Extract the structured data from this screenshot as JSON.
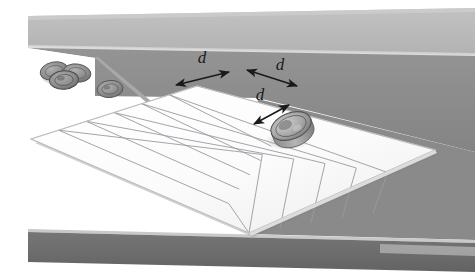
{
  "figure": {
    "width": 475,
    "height": 280
  },
  "labels": {
    "dimension_1": "d",
    "dimension_2": "d",
    "dimension_3": "d"
  },
  "annotations": [
    {
      "id": "grid-pitch-left",
      "label": "d",
      "meaning": "grid-cell-pitch-along-left-axis",
      "label_x": 202,
      "label_y": 63,
      "x1": 176,
      "y1": 85,
      "x2": 229,
      "y2": 72
    },
    {
      "id": "grid-pitch-right",
      "label": "d",
      "meaning": "grid-cell-pitch-along-right-axis",
      "label_x": 279,
      "label_y": 70,
      "x1": 247,
      "y1": 70,
      "x2": 297,
      "y2": 86
    },
    {
      "id": "coin-diameter",
      "label": "d",
      "meaning": "coin-diameter",
      "label_x": 262,
      "label_y": 98,
      "x1": 254,
      "y1": 124,
      "x2": 289,
      "y2": 105
    }
  ],
  "colors": {
    "background": "#ffffff",
    "wall_upper": "#b9b9b9",
    "wall_lower": "#8c8c8c",
    "table_front": "#8c8c8c",
    "table_edge_highlight": "#c9c9c9",
    "floor_dark": "#6d6d6d",
    "sheet_face": "#fdfdfd",
    "sheet_shade": "#f0f0f0",
    "grid_line": "#9a9aa2",
    "sheet_edge": "#c4c4c4",
    "coin_body": "#9b9b9b",
    "coin_rim": "#6f6f6f",
    "coin_face": "#b4b4b4",
    "coin_shadow": "#b0b0b0",
    "arrow": "#1a1a1a",
    "label_text": "#1a1a1a"
  },
  "grid": {
    "columns": 6,
    "rows": 6,
    "shape": "rhombus-perspective",
    "corner_left": {
      "x": 31,
      "y": 139
    },
    "corner_top": {
      "x": 197,
      "y": 86
    },
    "corner_right": {
      "x": 435,
      "y": 150
    },
    "corner_bottom": {
      "x": 249,
      "y": 233
    }
  },
  "objects": [
    {
      "name": "coin-on-grid",
      "type": "coin",
      "x": 291,
      "y": 126,
      "rx": 21,
      "ry": 13,
      "state": "standing-tilted-on-grid"
    },
    {
      "name": "coin-cluster-back",
      "type": "coin",
      "x": 54,
      "y": 71,
      "rx": 14,
      "ry": 9,
      "state": "flat-on-floor"
    },
    {
      "name": "coin-cluster-front",
      "type": "coin",
      "x": 64,
      "y": 79,
      "rx": 14,
      "ry": 9,
      "state": "flat-on-floor"
    },
    {
      "name": "coin-cluster-right",
      "type": "coin",
      "x": 77,
      "y": 73,
      "rx": 14,
      "ry": 9,
      "state": "flat-on-floor"
    },
    {
      "name": "coin-behind-edge",
      "type": "coin",
      "x": 110,
      "y": 89,
      "rx": 13,
      "ry": 9,
      "state": "partially-occluded-by-table"
    }
  ]
}
